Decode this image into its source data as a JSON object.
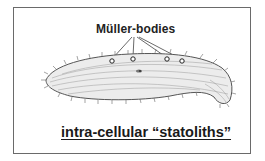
{
  "figure": {
    "label": "Müller-bodies",
    "caption": "intra-cellular “statoliths”",
    "organism": "ciliate-cell-drawing",
    "muller_bodies_count": 4,
    "colors": {
      "border": "#6a6a6a",
      "text": "#1a1a1a",
      "drawing": "#555555"
    }
  }
}
